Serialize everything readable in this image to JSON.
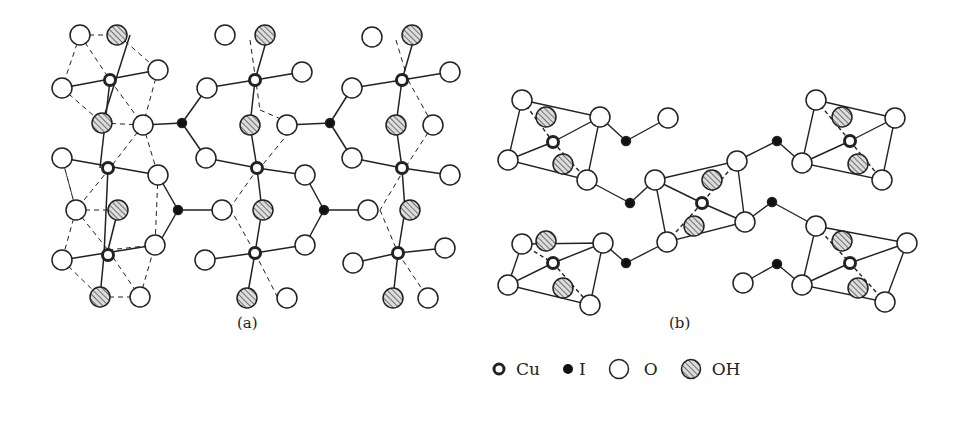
{
  "figure": {
    "panel_a": {
      "label": "(a)"
    },
    "panel_b": {
      "label": "(b)"
    },
    "legend": [
      {
        "symbol": "cu-atom",
        "label": "Cu"
      },
      {
        "symbol": "i-atom",
        "label": "I"
      },
      {
        "symbol": "o-atom",
        "label": "O"
      },
      {
        "symbol": "oh-group",
        "label": "OH"
      }
    ]
  }
}
